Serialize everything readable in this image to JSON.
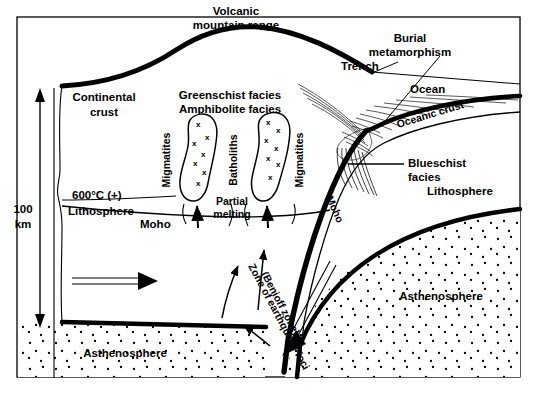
{
  "figure": {
    "type": "geological-cross-section",
    "frame_color": "#000000",
    "background_color": "#ffffff",
    "ink_color": "#000000"
  },
  "scale": {
    "value": "100",
    "unit": "km",
    "arrow": "double-headed-vertical"
  },
  "labels": {
    "volcanic_range_line1": "Volcanic",
    "volcanic_range_line2": "mountain range",
    "continental_crust_line1": "Continental",
    "continental_crust_line2": "crust",
    "greenschist": "Greenschist facies",
    "amphibolite": "Amphibolite facies",
    "migmatites_left": "Migmatites",
    "migmatites_right": "Migmatites",
    "batholiths": "Batholiths",
    "partial_line1": "Partial",
    "partial_line2": "melting",
    "isotherm": "600°C (+)",
    "lithosphere_left": "Lithosphere",
    "moho_left": "Moho",
    "moho_slab": "Moho",
    "asthenosphere_left": "Asthenosphere",
    "asthenosphere_right": "Asthenosphere",
    "lithosphere_right": "Lithosphere",
    "trench": "Trench",
    "ocean": "Ocean",
    "oceanic_crust": "Oceanic crust",
    "burial_line1": "Burial",
    "burial_line2": "metamorphism",
    "blueschist_line1": "Blueschist",
    "blueschist_line2": "facies",
    "benioff_line1": "Zone of earthquake foci",
    "benioff_line2": "(Benioff zone)"
  },
  "arrows": {
    "mantle_flow_right": "horizontal open arrow pointing right in lithospheric mantle",
    "subduction_direction": "double-line arrow pointing down-left along slab",
    "melt_ascent_left": "arrow up into left batholith",
    "melt_ascent_right": "arrow up into right batholith",
    "convection_1": "curved arrow up",
    "convection_2": "curved arrow up",
    "convection_3": "curved arrow up-left from slab base"
  }
}
